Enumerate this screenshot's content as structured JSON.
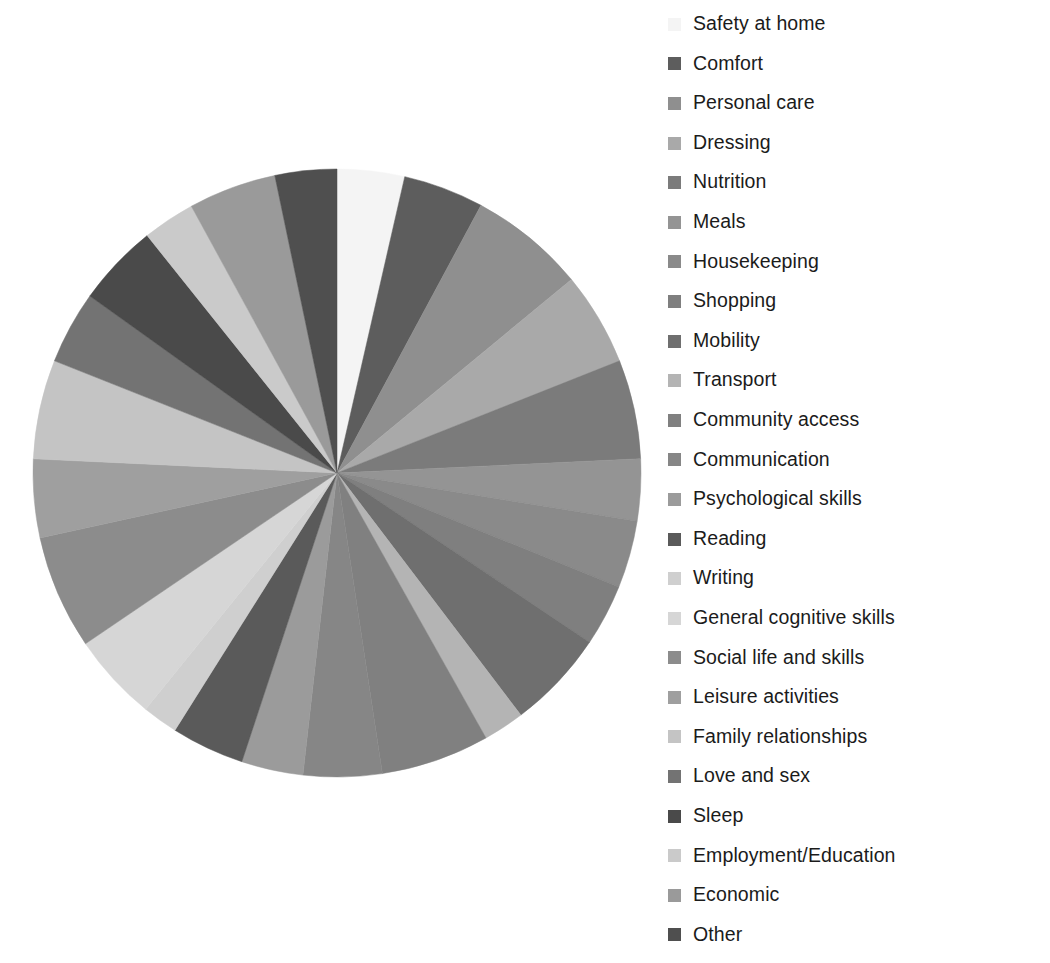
{
  "chart_data": {
    "type": "pie",
    "title": "",
    "subtitle": "",
    "xlabel": "",
    "ylabel": "",
    "grid": false,
    "legend_position": "right",
    "start_angle_deg": 0,
    "direction": "clockwise",
    "center": {
      "x": 337,
      "y": 473
    },
    "radius": 305,
    "categories": [
      "Safety at home",
      "Comfort",
      "Personal care",
      "Dressing",
      "Nutrition",
      "Meals",
      "Housekeeping",
      "Shopping",
      "Mobility",
      "Transport",
      "Community access",
      "Communication",
      "Psychological skills",
      "Reading",
      "Writing",
      "General cognitive skills",
      "Social life and skills",
      "Leisure activities",
      "Family relationships",
      "Love and sex",
      "Sleep",
      "Employment/Education",
      "Economic",
      "Other"
    ],
    "values": [
      3.6,
      4.3,
      6.2,
      5.0,
      5.3,
      3.3,
      3.6,
      3.3,
      5.3,
      2.2,
      5.8,
      4.2,
      3.3,
      3.9,
      1.9,
      4.7,
      6.1,
      4.2,
      5.3,
      3.9,
      4.4,
      2.8,
      4.7,
      3.3
    ],
    "units": "percent",
    "colors": [
      "#f4f4f4",
      "#5d5d5d",
      "#8f8f8f",
      "#a9a9a9",
      "#7b7b7b",
      "#949494",
      "#8a8a8a",
      "#7f7f7f",
      "#6f6f6f",
      "#b4b4b4",
      "#808080",
      "#868686",
      "#9b9b9b",
      "#5a5a5a",
      "#cfcfcf",
      "#d6d6d6",
      "#8c8c8c",
      "#9f9f9f",
      "#c4c4c4",
      "#737373",
      "#4a4a4a",
      "#cacaca",
      "#9a9a9a",
      "#4f4f4f"
    ]
  },
  "legend": {
    "items": [
      {
        "label": "Safety at home",
        "color": "#f4f4f4"
      },
      {
        "label": "Comfort",
        "color": "#5d5d5d"
      },
      {
        "label": "Personal care",
        "color": "#8f8f8f"
      },
      {
        "label": "Dressing",
        "color": "#a9a9a9"
      },
      {
        "label": "Nutrition",
        "color": "#7b7b7b"
      },
      {
        "label": "Meals",
        "color": "#949494"
      },
      {
        "label": "Housekeeping",
        "color": "#8a8a8a"
      },
      {
        "label": "Shopping",
        "color": "#7f7f7f"
      },
      {
        "label": "Mobility",
        "color": "#6f6f6f"
      },
      {
        "label": "Transport",
        "color": "#b4b4b4"
      },
      {
        "label": "Community access",
        "color": "#808080"
      },
      {
        "label": "Communication",
        "color": "#868686"
      },
      {
        "label": "Psychological skills",
        "color": "#9b9b9b"
      },
      {
        "label": "Reading",
        "color": "#5a5a5a"
      },
      {
        "label": "Writing",
        "color": "#cfcfcf"
      },
      {
        "label": "General cognitive skills",
        "color": "#d6d6d6"
      },
      {
        "label": "Social life and skills",
        "color": "#8c8c8c"
      },
      {
        "label": "Leisure activities",
        "color": "#9f9f9f"
      },
      {
        "label": "Family relationships",
        "color": "#c4c4c4"
      },
      {
        "label": "Love and sex",
        "color": "#737373"
      },
      {
        "label": "Sleep",
        "color": "#4a4a4a"
      },
      {
        "label": "Employment/Education",
        "color": "#cacaca"
      },
      {
        "label": "Economic",
        "color": "#9a9a9a"
      },
      {
        "label": "Other",
        "color": "#4f4f4f"
      }
    ]
  }
}
